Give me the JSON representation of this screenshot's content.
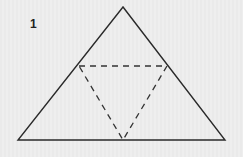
{
  "figure": {
    "label": "1",
    "outer_triangle": {
      "apex": [
        123,
        7
      ],
      "base_left": [
        18,
        140
      ],
      "base_right": [
        225,
        140
      ],
      "stroke": "#2a2a2a"
    },
    "inner_triangle_dashed": {
      "top_left": [
        79,
        66
      ],
      "top_right": [
        167,
        66
      ],
      "bottom": [
        123,
        140
      ],
      "stroke": "#333333"
    }
  }
}
